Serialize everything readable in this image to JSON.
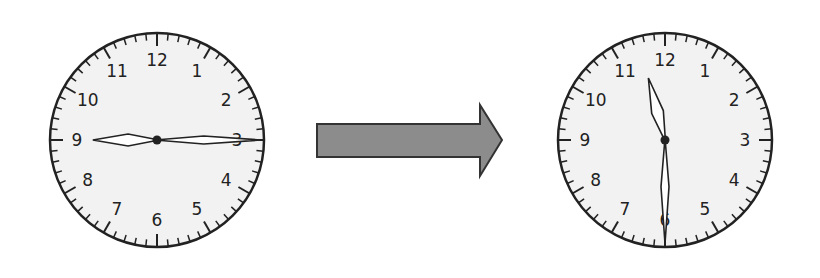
{
  "diagram": {
    "start_clock": {
      "label": "start",
      "time": "2:45",
      "hour_hand_points_to": 9,
      "minute_hand_points_to": 3,
      "numerals": [
        "12",
        "1",
        "2",
        "3",
        "4",
        "5",
        "6",
        "7",
        "8",
        "9",
        "10",
        "11"
      ]
    },
    "arrow": {
      "direction": "right",
      "fill": "#8c8c8c",
      "stroke": "#333333"
    },
    "end_clock": {
      "label": "end",
      "time": "11:30",
      "hour_hand_points_to": 11.5,
      "minute_hand_points_to": 6,
      "numerals": [
        "12",
        "1",
        "2",
        "3",
        "4",
        "5",
        "6",
        "7",
        "8",
        "9",
        "10",
        "11"
      ]
    },
    "colors": {
      "face": "#f2f2f2",
      "ink": "#222222",
      "background": "#ffffff"
    }
  }
}
